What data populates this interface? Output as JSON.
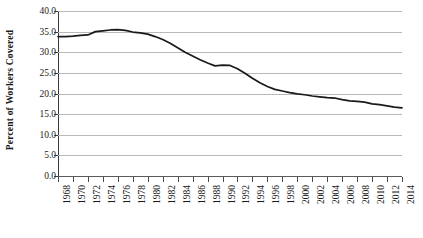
{
  "chart_data": {
    "type": "line",
    "title": "",
    "xlabel": "",
    "ylabel": "Percent of Workers Covered",
    "ylim": [
      0.0,
      40.0
    ],
    "ytick_values": [
      0.0,
      5.0,
      10.0,
      15.0,
      20.0,
      25.0,
      30.0,
      35.0,
      40.0
    ],
    "ytick_labels": [
      "0.0",
      "5.0",
      "10.0",
      "15.0",
      "20.0",
      "25.0",
      "30.0",
      "35.0",
      "40.0"
    ],
    "xlim": [
      1968,
      2014
    ],
    "xtick_values": [
      1968,
      1970,
      1972,
      1974,
      1976,
      1978,
      1980,
      1982,
      1984,
      1986,
      1988,
      1990,
      1992,
      1994,
      1996,
      1998,
      2000,
      2002,
      2004,
      2006,
      2008,
      2010,
      2012,
      2014
    ],
    "xtick_labels": [
      "1968",
      "1970",
      "1972",
      "1974",
      "1976",
      "1978",
      "1980",
      "1982",
      "1984",
      "1986",
      "1988",
      "1990",
      "1992",
      "1994",
      "1996",
      "1998",
      "2000",
      "2002",
      "2004",
      "2006",
      "2008",
      "2010",
      "2012",
      "2014"
    ],
    "grid": true,
    "grid_axis": "y",
    "legend": false,
    "line_color": "#1a1a1a",
    "grid_color": "#b9b9b9",
    "x": [
      1968,
      1969,
      1970,
      1971,
      1972,
      1973,
      1974,
      1975,
      1976,
      1977,
      1978,
      1979,
      1980,
      1981,
      1982,
      1983,
      1984,
      1985,
      1986,
      1987,
      1988,
      1989,
      1990,
      1991,
      1992,
      1993,
      1994,
      1995,
      1996,
      1997,
      1998,
      1999,
      2000,
      2001,
      2002,
      2003,
      2004,
      2005,
      2006,
      2007,
      2008,
      2009,
      2010,
      2011,
      2012,
      2013,
      2014
    ],
    "values": [
      33.8,
      33.8,
      33.9,
      34.1,
      34.2,
      35.0,
      35.2,
      35.4,
      35.5,
      35.3,
      34.9,
      34.7,
      34.4,
      33.8,
      33.1,
      32.2,
      31.1,
      30.0,
      29.1,
      28.2,
      27.4,
      26.7,
      26.9,
      26.8,
      26.0,
      24.9,
      23.7,
      22.6,
      21.7,
      21.0,
      20.6,
      20.2,
      19.9,
      19.7,
      19.4,
      19.2,
      19.0,
      18.9,
      18.5,
      18.2,
      18.1,
      17.9,
      17.5,
      17.3,
      17.0,
      16.7,
      16.5
    ],
    "annotations": []
  }
}
